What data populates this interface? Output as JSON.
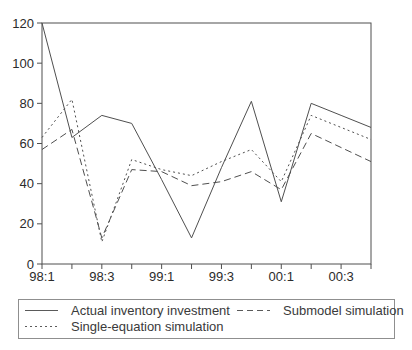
{
  "chart_data": {
    "type": "line",
    "title": "",
    "xlabel": "",
    "ylabel": "",
    "categories": [
      "98:1",
      "98:2",
      "98:3",
      "98:4",
      "99:1",
      "99:2",
      "99:3",
      "99:4",
      "00:1",
      "00:2",
      "00:3",
      "00:4"
    ],
    "x_tick_labels": [
      "98:1",
      "98:3",
      "99:1",
      "99:3",
      "00:1",
      "00:3"
    ],
    "labeled_every": 2,
    "y_ticks": [
      0,
      20,
      40,
      60,
      80,
      100,
      120
    ],
    "ylim": [
      0,
      120
    ],
    "grid": false,
    "legend_position": "bottom-box",
    "line_color": "#4f4f4f",
    "series": [
      {
        "name": "Actual inventory investment",
        "style": "solid",
        "values": [
          120,
          63,
          74,
          70,
          42,
          13,
          48,
          81,
          31,
          80,
          74,
          68
        ]
      },
      {
        "name": "Submodel simulation",
        "style": "long-dash",
        "values": [
          57,
          67,
          13,
          47,
          46,
          39,
          41,
          46,
          37,
          65,
          58,
          51
        ]
      },
      {
        "name": "Single-equation simulation",
        "style": "short-dash",
        "values": [
          63,
          82,
          11,
          52,
          47,
          44,
          51,
          57,
          41,
          74,
          68,
          62
        ]
      }
    ]
  },
  "legend": {
    "items": [
      {
        "label": "Actual inventory investment",
        "style": "solid"
      },
      {
        "label": "Submodel simulation",
        "style": "long-dash"
      },
      {
        "label": "Single-equation simulation",
        "style": "short-dash"
      }
    ]
  }
}
